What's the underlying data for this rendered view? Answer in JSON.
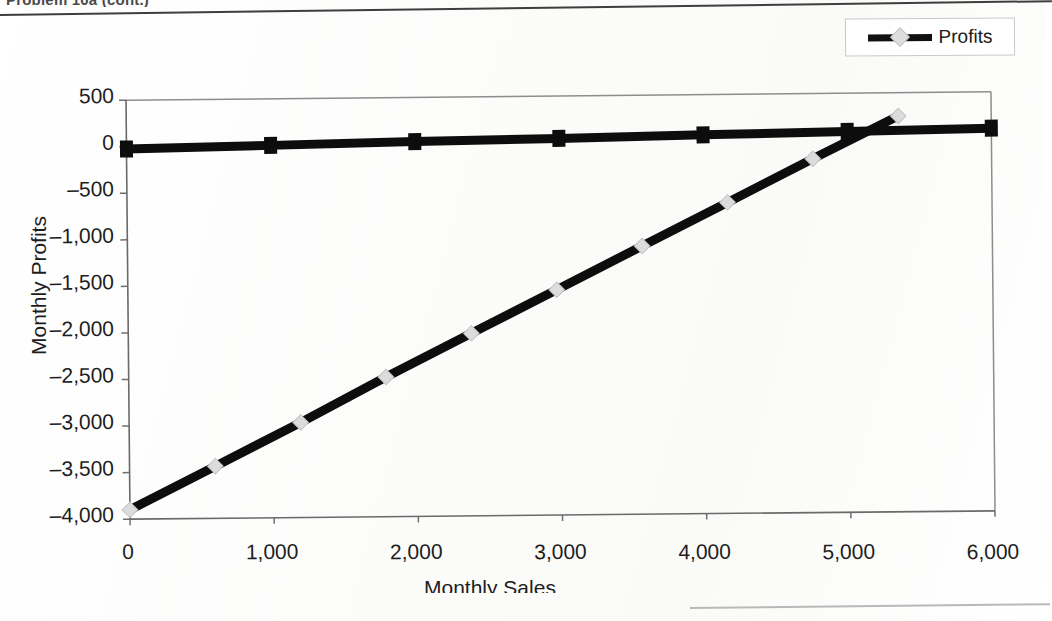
{
  "page": {
    "cut_off_title": "Problem 10a (cont.)",
    "background_color": "#fdfdfc"
  },
  "legend": {
    "entries": [
      {
        "label": "Profits",
        "line_color": "#111111",
        "marker": "diamond",
        "marker_color": "#dedede"
      }
    ],
    "position": "top-right",
    "border_color": "#c9c9c9"
  },
  "chart_data": {
    "type": "line",
    "title": "",
    "xlabel": "Monthly Sales",
    "ylabel": "Monthly Profits",
    "xlim": [
      0,
      6000
    ],
    "ylim": [
      -4000,
      500
    ],
    "xticks": [
      0,
      1000,
      2000,
      3000,
      4000,
      5000,
      6000
    ],
    "xtick_labels": [
      "0",
      "1,000",
      "2,000",
      "3,000",
      "4,000",
      "5,000",
      "6,000"
    ],
    "yticks": [
      500,
      0,
      -500,
      -1000,
      -1500,
      -2000,
      -2500,
      -3000,
      -3500,
      -4000
    ],
    "ytick_labels": [
      "500",
      "0",
      "-500",
      "-1,000",
      "-1,500",
      "-2,000",
      "-2,500",
      "-3,000",
      "-3,500",
      "-4,000"
    ],
    "grid": false,
    "legend_position": "top-right",
    "series": [
      {
        "name": "Profits",
        "marker": "diamond",
        "marker_color": "#dcdcdc",
        "line_color": "#0d0d0d",
        "line_width": 9,
        "marker_size": 11,
        "x": [
          0,
          595,
          1190,
          1785,
          2380,
          2975,
          3570,
          4165,
          4760,
          5355
        ],
        "y": [
          -3900,
          -3440,
          -2980,
          -2500,
          -2040,
          -1580,
          -1120,
          -660,
          -200,
          250
        ]
      },
      {
        "name": "Fixed baseline",
        "marker": "square",
        "marker_color": "#0d0d0d",
        "line_color": "#0d0d0d",
        "line_width": 9,
        "marker_size": 13,
        "x": [
          0,
          1000,
          2000,
          3000,
          4000,
          5000,
          6000
        ],
        "y": [
          -25,
          0,
          25,
          45,
          68,
          90,
          110
        ]
      }
    ]
  }
}
